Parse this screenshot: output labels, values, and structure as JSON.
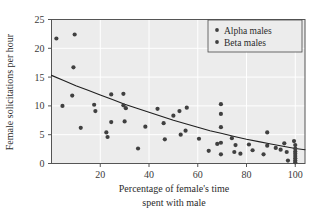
{
  "chart_data": {
    "type": "scatter",
    "title": "",
    "xlabel": "Percentage of female's time spent with male",
    "xlabel_line1": "Percentage of female's time",
    "xlabel_line2": "spent with male",
    "ylabel": "Female solicitations per hour",
    "xlim": [
      0,
      104
    ],
    "ylim": [
      0,
      25
    ],
    "xticks": [
      20,
      40,
      60,
      80,
      100
    ],
    "xtick_labels": [
      "20",
      "40",
      "60",
      "80",
      "100"
    ],
    "yticks": [
      0,
      5,
      10,
      15,
      20,
      25
    ],
    "ytick_labels": [
      "0",
      "5",
      "10",
      "15",
      "20",
      "25"
    ],
    "grid": true,
    "grid_color": "#ffffff",
    "plot_background": "#ececec",
    "marker_color": "#404040",
    "legend_position": "top-right",
    "legend": [
      {
        "name": "Alpha males",
        "marker": "dot",
        "color": "#404040"
      },
      {
        "name": "Beta males",
        "marker": "dot",
        "color": "#404040"
      }
    ],
    "series": [
      {
        "name": "Alpha males",
        "color": "#404040",
        "points": [
          [
            2.0,
            21.7
          ],
          [
            9.5,
            22.4
          ],
          [
            9.0,
            16.7
          ],
          [
            8.5,
            11.8
          ],
          [
            4.5,
            10.0
          ],
          [
            17.5,
            10.2
          ],
          [
            18.0,
            9.1
          ],
          [
            12.0,
            6.2
          ],
          [
            22.5,
            5.4
          ],
          [
            23.0,
            4.6
          ],
          [
            24.5,
            12.0
          ],
          [
            29.5,
            12.1
          ],
          [
            24.5,
            7.2
          ],
          [
            29.5,
            10.1
          ],
          [
            30.5,
            9.6
          ],
          [
            30.0,
            7.3
          ],
          [
            35.5,
            2.6
          ],
          [
            38.5,
            6.4
          ],
          [
            43.5,
            9.5
          ],
          [
            46.0,
            7.0
          ],
          [
            46.5,
            4.2
          ],
          [
            50.0,
            8.3
          ],
          [
            52.5,
            9.1
          ],
          [
            55.5,
            9.7
          ],
          [
            53.0,
            5.0
          ],
          [
            55.0,
            5.7
          ],
          [
            60.5,
            4.3
          ],
          [
            64.5,
            2.2
          ],
          [
            68.0,
            3.4
          ],
          [
            69.5,
            10.3
          ],
          [
            69.5,
            8.6
          ],
          [
            69.5,
            6.3
          ],
          [
            69.5,
            3.6
          ],
          [
            69.5,
            1.6
          ],
          [
            74.0,
            4.4
          ],
          [
            75.5,
            3.2
          ],
          [
            75.0,
            2.0
          ],
          [
            77.5,
            1.7
          ],
          [
            81.0,
            3.3
          ],
          [
            82.5,
            2.3
          ],
          [
            87.0,
            1.6
          ],
          [
            88.5,
            5.4
          ],
          [
            88.5,
            3.1
          ],
          [
            92.0,
            2.7
          ],
          [
            94.0,
            2.4
          ],
          [
            95.5,
            3.5
          ],
          [
            96.5,
            2.0
          ],
          [
            97.0,
            0.5
          ],
          [
            99.5,
            3.9
          ]
        ]
      },
      {
        "name": "Beta males",
        "color": "#404040",
        "points": [
          [
            100.0,
            3.2
          ],
          [
            100.0,
            2.6
          ],
          [
            100.0,
            2.1
          ],
          [
            100.0,
            1.7
          ],
          [
            100.0,
            1.3
          ],
          [
            100.0,
            0.9
          ],
          [
            100.0,
            0.5
          ],
          [
            100.0,
            0.2
          ]
        ]
      }
    ],
    "fit_curve": {
      "description": "exponential decay trend line",
      "y0": 15.3,
      "y100": 2.5,
      "points": [
        [
          0,
          15.3
        ],
        [
          5,
          14.4
        ],
        [
          10,
          13.5
        ],
        [
          15,
          12.7
        ],
        [
          20,
          11.9
        ],
        [
          25,
          11.1
        ],
        [
          30,
          10.3
        ],
        [
          35,
          9.6
        ],
        [
          40,
          8.9
        ],
        [
          45,
          8.2
        ],
        [
          50,
          7.5
        ],
        [
          55,
          6.9
        ],
        [
          60,
          6.3
        ],
        [
          65,
          5.7
        ],
        [
          70,
          5.2
        ],
        [
          75,
          4.7
        ],
        [
          80,
          4.2
        ],
        [
          85,
          3.8
        ],
        [
          90,
          3.4
        ],
        [
          95,
          3.0
        ],
        [
          100,
          2.6
        ],
        [
          104,
          2.4
        ]
      ]
    }
  }
}
